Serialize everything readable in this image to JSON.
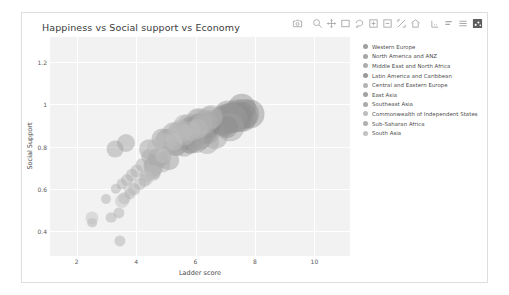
{
  "card": {
    "title": "Happiness vs Social support vs Economy"
  },
  "modebar": {
    "buttons": [
      {
        "name": "camera-icon",
        "glyph": "camera"
      },
      {
        "name": "zoom-icon",
        "glyph": "zoom"
      },
      {
        "name": "pan-icon",
        "glyph": "pan"
      },
      {
        "name": "zoom-in-box-icon",
        "glyph": "zoombox"
      },
      {
        "name": "lasso-select-icon",
        "glyph": "lasso"
      },
      {
        "name": "zoom-in-icon",
        "glyph": "plusbox"
      },
      {
        "name": "zoom-out-icon",
        "glyph": "minusbox"
      },
      {
        "name": "autoscale-icon",
        "glyph": "autoscale"
      },
      {
        "name": "reset-axes-icon",
        "glyph": "home"
      },
      {
        "name": "toggle-spike-lines-icon",
        "glyph": "spike"
      },
      {
        "name": "hover-compare-icon",
        "glyph": "barcompare"
      },
      {
        "name": "hover-closest-icon",
        "glyph": "barclosest"
      },
      {
        "name": "plotly-logo-icon",
        "glyph": "logo"
      }
    ]
  },
  "chart_data": {
    "type": "scatter",
    "title": "Happiness vs Social support vs Economy",
    "xlabel": "Ladder score",
    "ylabel": "Social Support",
    "xlim": [
      1.1,
      11.2
    ],
    "ylim": [
      0.28,
      1.32
    ],
    "xticks": [
      "2",
      "4",
      "6",
      "8",
      "10"
    ],
    "xtickvals": [
      2,
      4,
      6,
      8,
      10
    ],
    "yticks": [
      "1.2",
      "1",
      "0.8",
      "0.6",
      "0.4"
    ],
    "ytickvals": [
      1.2,
      1.0,
      0.8,
      0.6,
      0.4
    ],
    "grid": true,
    "legend_position": "right",
    "size_encoding": "Economy (GDP per capita)",
    "legend": [
      "Western Europe",
      "North America and ANZ",
      "Middle East and North Africa",
      "Latin America and Caribbean",
      "Central and Eastern Europe",
      "East Asia",
      "Southeast Asia",
      "Commonwealth of Independent States",
      "Sub-Saharan Africa",
      "South Asia"
    ],
    "legend_colors": [
      "#9e9e9e",
      "#a6a6a6",
      "#adadad",
      "#9a9a9a",
      "#b3b3b3",
      "#a2a2a2",
      "#aaaaaa",
      "#bdbdbd",
      "#b0b0b0",
      "#c2c2c2"
    ],
    "series": [
      {
        "name": "Western Europe",
        "color": "#8f8f8f",
        "points": [
          {
            "x": 7.84,
            "y": 0.954,
            "s": 1.45
          },
          {
            "x": 7.62,
            "y": 0.954,
            "s": 1.5
          },
          {
            "x": 7.57,
            "y": 0.942,
            "s": 1.5
          },
          {
            "x": 7.55,
            "y": 0.983,
            "s": 1.42
          },
          {
            "x": 7.46,
            "y": 0.934,
            "s": 1.4
          },
          {
            "x": 7.39,
            "y": 0.954,
            "s": 1.46
          },
          {
            "x": 7.36,
            "y": 0.942,
            "s": 1.45
          },
          {
            "x": 7.32,
            "y": 0.947,
            "s": 1.38
          },
          {
            "x": 7.28,
            "y": 0.934,
            "s": 1.43
          },
          {
            "x": 7.16,
            "y": 0.942,
            "s": 1.42
          },
          {
            "x": 7.08,
            "y": 0.927,
            "s": 1.4
          },
          {
            "x": 7.03,
            "y": 0.928,
            "s": 1.38
          },
          {
            "x": 6.97,
            "y": 0.936,
            "s": 1.34
          },
          {
            "x": 6.9,
            "y": 0.92,
            "s": 1.38
          },
          {
            "x": 6.55,
            "y": 0.913,
            "s": 1.3
          },
          {
            "x": 6.49,
            "y": 0.901,
            "s": 1.28
          },
          {
            "x": 6.43,
            "y": 0.907,
            "s": 1.25
          },
          {
            "x": 6.33,
            "y": 0.872,
            "s": 1.24
          },
          {
            "x": 6.18,
            "y": 0.889,
            "s": 1.22
          },
          {
            "x": 5.93,
            "y": 0.883,
            "s": 1.21
          },
          {
            "x": 5.84,
            "y": 0.822,
            "s": 1.15
          }
        ]
      },
      {
        "name": "North America and ANZ",
        "color": "#969696",
        "points": [
          {
            "x": 7.28,
            "y": 0.934,
            "s": 1.42
          },
          {
            "x": 7.18,
            "y": 0.94,
            "s": 1.4
          },
          {
            "x": 7.1,
            "y": 0.948,
            "s": 1.44
          },
          {
            "x": 6.95,
            "y": 0.92,
            "s": 1.48
          }
        ]
      },
      {
        "name": "Middle East and North Africa",
        "color": "#a0a0a0",
        "points": [
          {
            "x": 7.16,
            "y": 0.891,
            "s": 1.38
          },
          {
            "x": 6.64,
            "y": 0.849,
            "s": 1.3
          },
          {
            "x": 6.37,
            "y": 0.879,
            "s": 1.44
          },
          {
            "x": 6.02,
            "y": 0.824,
            "s": 1.2
          },
          {
            "x": 5.62,
            "y": 0.805,
            "s": 1.14
          },
          {
            "x": 5.27,
            "y": 0.86,
            "s": 1.18
          },
          {
            "x": 5.04,
            "y": 0.832,
            "s": 1.12
          },
          {
            "x": 4.88,
            "y": 0.835,
            "s": 1.05
          },
          {
            "x": 4.73,
            "y": 0.748,
            "s": 1.0
          },
          {
            "x": 4.58,
            "y": 0.701,
            "s": 0.96
          },
          {
            "x": 4.42,
            "y": 0.788,
            "s": 0.98
          },
          {
            "x": 3.66,
            "y": 0.817,
            "s": 0.9
          },
          {
            "x": 3.29,
            "y": 0.787,
            "s": 0.84
          }
        ]
      },
      {
        "name": "Latin America and Caribbean",
        "color": "#8c8c8c",
        "points": [
          {
            "x": 7.07,
            "y": 0.892,
            "s": 1.1
          },
          {
            "x": 6.48,
            "y": 0.91,
            "s": 1.12
          },
          {
            "x": 6.43,
            "y": 0.892,
            "s": 1.08
          },
          {
            "x": 6.33,
            "y": 0.885,
            "s": 1.06
          },
          {
            "x": 6.3,
            "y": 0.869,
            "s": 1.14
          },
          {
            "x": 6.19,
            "y": 0.836,
            "s": 1.04
          },
          {
            "x": 6.11,
            "y": 0.883,
            "s": 1.02
          },
          {
            "x": 6.08,
            "y": 0.898,
            "s": 1.0
          },
          {
            "x": 5.99,
            "y": 0.869,
            "s": 1.06
          },
          {
            "x": 5.92,
            "y": 0.843,
            "s": 1.0
          },
          {
            "x": 5.86,
            "y": 0.854,
            "s": 0.97
          },
          {
            "x": 5.79,
            "y": 0.827,
            "s": 0.95
          },
          {
            "x": 5.71,
            "y": 0.843,
            "s": 0.93
          },
          {
            "x": 5.65,
            "y": 0.833,
            "s": 0.96
          },
          {
            "x": 5.54,
            "y": 0.862,
            "s": 0.92
          },
          {
            "x": 5.47,
            "y": 0.827,
            "s": 0.9
          },
          {
            "x": 5.3,
            "y": 0.823,
            "s": 0.88
          },
          {
            "x": 4.57,
            "y": 0.68,
            "s": 0.74
          }
        ]
      },
      {
        "name": "Central and Eastern Europe",
        "color": "#b0b0b0",
        "points": [
          {
            "x": 6.53,
            "y": 0.94,
            "s": 1.2
          },
          {
            "x": 6.48,
            "y": 0.937,
            "s": 1.16
          },
          {
            "x": 6.33,
            "y": 0.915,
            "s": 1.18
          },
          {
            "x": 6.24,
            "y": 0.919,
            "s": 1.14
          },
          {
            "x": 6.19,
            "y": 0.903,
            "s": 1.12
          },
          {
            "x": 6.16,
            "y": 0.894,
            "s": 1.1
          },
          {
            "x": 6.12,
            "y": 0.929,
            "s": 1.08
          },
          {
            "x": 6.05,
            "y": 0.933,
            "s": 1.06
          },
          {
            "x": 5.93,
            "y": 0.904,
            "s": 1.12
          },
          {
            "x": 5.88,
            "y": 0.888,
            "s": 1.04
          },
          {
            "x": 5.82,
            "y": 0.873,
            "s": 1.02
          },
          {
            "x": 5.75,
            "y": 0.908,
            "s": 1.0
          },
          {
            "x": 5.62,
            "y": 0.902,
            "s": 1.04
          },
          {
            "x": 5.47,
            "y": 0.874,
            "s": 0.98
          },
          {
            "x": 5.38,
            "y": 0.869,
            "s": 0.96
          },
          {
            "x": 5.15,
            "y": 0.838,
            "s": 0.92
          }
        ]
      },
      {
        "name": "East Asia",
        "color": "#999999",
        "points": [
          {
            "x": 6.1,
            "y": 0.898,
            "s": 1.22
          },
          {
            "x": 5.94,
            "y": 0.862,
            "s": 1.34
          },
          {
            "x": 5.85,
            "y": 0.885,
            "s": 1.26
          },
          {
            "x": 5.77,
            "y": 0.824,
            "s": 1.16
          },
          {
            "x": 5.34,
            "y": 0.809,
            "s": 1.1
          },
          {
            "x": 5.12,
            "y": 0.736,
            "s": 0.98
          }
        ]
      },
      {
        "name": "Southeast Asia",
        "color": "#a8a8a8",
        "points": [
          {
            "x": 6.38,
            "y": 0.822,
            "s": 1.2
          },
          {
            "x": 6.08,
            "y": 0.884,
            "s": 1.02
          },
          {
            "x": 5.99,
            "y": 0.826,
            "s": 1.0
          },
          {
            "x": 5.81,
            "y": 0.862,
            "s": 0.98
          },
          {
            "x": 5.38,
            "y": 0.799,
            "s": 0.92
          },
          {
            "x": 5.27,
            "y": 0.812,
            "s": 0.9
          },
          {
            "x": 4.89,
            "y": 0.76,
            "s": 0.82
          },
          {
            "x": 4.43,
            "y": 0.751,
            "s": 0.78
          }
        ]
      },
      {
        "name": "Commonwealth of Independent States",
        "color": "#bababa",
        "points": [
          {
            "x": 6.18,
            "y": 0.902,
            "s": 1.06
          },
          {
            "x": 6.08,
            "y": 0.885,
            "s": 1.0
          },
          {
            "x": 5.85,
            "y": 0.876,
            "s": 1.02
          },
          {
            "x": 5.63,
            "y": 0.853,
            "s": 0.98
          },
          {
            "x": 5.54,
            "y": 0.866,
            "s": 0.96
          },
          {
            "x": 5.47,
            "y": 0.884,
            "s": 0.94
          },
          {
            "x": 5.29,
            "y": 0.845,
            "s": 0.92
          },
          {
            "x": 5.01,
            "y": 0.817,
            "s": 0.88
          },
          {
            "x": 4.89,
            "y": 0.827,
            "s": 0.86
          },
          {
            "x": 4.63,
            "y": 0.797,
            "s": 0.82
          }
        ]
      },
      {
        "name": "Sub-Saharan Africa",
        "color": "#adadad",
        "points": [
          {
            "x": 5.15,
            "y": 0.798,
            "s": 0.72
          },
          {
            "x": 4.95,
            "y": 0.748,
            "s": 0.7
          },
          {
            "x": 4.89,
            "y": 0.713,
            "s": 0.76
          },
          {
            "x": 4.8,
            "y": 0.739,
            "s": 0.68
          },
          {
            "x": 4.73,
            "y": 0.722,
            "s": 0.72
          },
          {
            "x": 4.62,
            "y": 0.7,
            "s": 0.66
          },
          {
            "x": 4.55,
            "y": 0.684,
            "s": 0.7
          },
          {
            "x": 4.46,
            "y": 0.718,
            "s": 0.64
          },
          {
            "x": 4.37,
            "y": 0.662,
            "s": 0.68
          },
          {
            "x": 4.29,
            "y": 0.64,
            "s": 0.62
          },
          {
            "x": 4.19,
            "y": 0.711,
            "s": 0.66
          },
          {
            "x": 4.12,
            "y": 0.62,
            "s": 0.6
          },
          {
            "x": 4.02,
            "y": 0.683,
            "s": 0.64
          },
          {
            "x": 3.94,
            "y": 0.597,
            "s": 0.58
          },
          {
            "x": 3.85,
            "y": 0.663,
            "s": 0.62
          },
          {
            "x": 3.78,
            "y": 0.574,
            "s": 0.56
          },
          {
            "x": 3.69,
            "y": 0.641,
            "s": 0.6
          },
          {
            "x": 3.6,
            "y": 0.554,
            "s": 0.58
          },
          {
            "x": 3.51,
            "y": 0.62,
            "s": 0.54
          },
          {
            "x": 3.42,
            "y": 0.486,
            "s": 0.56
          },
          {
            "x": 3.32,
            "y": 0.598,
            "s": 0.52
          },
          {
            "x": 3.15,
            "y": 0.463,
            "s": 0.54
          },
          {
            "x": 3.0,
            "y": 0.552,
            "s": 0.5
          },
          {
            "x": 2.52,
            "y": 0.437,
            "s": 0.48
          },
          {
            "x": 3.46,
            "y": 0.353,
            "s": 0.56
          }
        ]
      },
      {
        "name": "South Asia",
        "color": "#c0c0c0",
        "points": [
          {
            "x": 5.27,
            "y": 0.82,
            "s": 0.84
          },
          {
            "x": 4.89,
            "y": 0.757,
            "s": 0.78
          },
          {
            "x": 4.55,
            "y": 0.673,
            "s": 0.8
          },
          {
            "x": 4.34,
            "y": 0.651,
            "s": 0.74
          },
          {
            "x": 3.82,
            "y": 0.599,
            "s": 0.72
          },
          {
            "x": 3.51,
            "y": 0.54,
            "s": 0.7
          },
          {
            "x": 2.52,
            "y": 0.463,
            "s": 0.66
          }
        ]
      }
    ]
  }
}
